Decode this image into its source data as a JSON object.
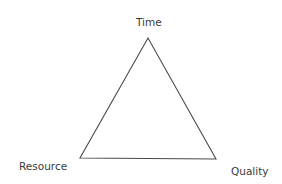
{
  "diagram": {
    "type": "triangle",
    "title": "",
    "vertices": [
      {
        "id": "time",
        "label": "Time",
        "x": 148,
        "y": 38
      },
      {
        "id": "resource",
        "label": "Resource",
        "x": 80,
        "y": 158
      },
      {
        "id": "quality",
        "label": "Quality",
        "x": 216,
        "y": 159
      }
    ],
    "stroke_color": "#4a4a4a",
    "text_color": "#3a3a3a",
    "background": "#ffffff"
  }
}
